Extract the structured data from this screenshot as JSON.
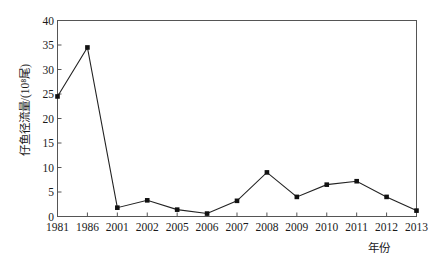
{
  "chart_data": {
    "type": "line",
    "title": "",
    "xlabel": "年份",
    "ylabel": "仔鱼径流量/(10⁸尾)",
    "categories": [
      "1981",
      "1986",
      "2001",
      "2002",
      "2005",
      "2006",
      "2007",
      "2008",
      "2009",
      "2010",
      "2011",
      "2012",
      "2013"
    ],
    "values": [
      24.5,
      34.5,
      1.8,
      3.3,
      1.4,
      0.6,
      3.2,
      9.0,
      4.0,
      6.5,
      7.2,
      4.0,
      1.2
    ],
    "ylim": [
      0,
      40
    ],
    "yticks": [
      0,
      5,
      10,
      15,
      20,
      25,
      30,
      35,
      40
    ],
    "ytick_labels": [
      "0",
      "5",
      "10",
      "15",
      "20",
      "25",
      "30",
      "35",
      "40"
    ],
    "grid": false,
    "legend": "none",
    "marker": "square",
    "marker_color": "#111111",
    "line_color": "#222222",
    "axis_color": "#555555",
    "background": "#ffffff"
  }
}
